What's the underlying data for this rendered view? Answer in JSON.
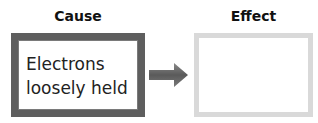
{
  "cause": {
    "heading": "Cause",
    "text_line1": "Electrons",
    "text_line2": "loosely held"
  },
  "effect": {
    "heading": "Effect",
    "text": ""
  },
  "connector": {
    "icon": "right-arrow-icon"
  },
  "colors": {
    "cause_border": "#5e5e5e",
    "effect_border": "#d9d9d9",
    "arrow": "#6a6a6a"
  }
}
